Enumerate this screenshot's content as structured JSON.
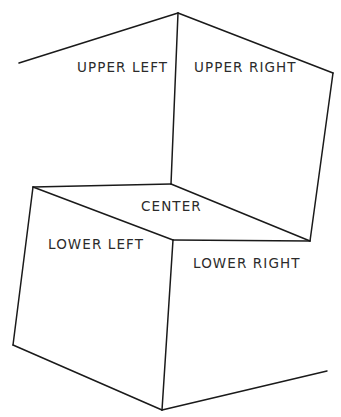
{
  "figure": {
    "background_color": "#ffffff",
    "stroke_color": "#1a1a1a",
    "text_color": "#2b2b2b"
  },
  "labels": {
    "upper_left": "UPPER LEFT",
    "upper_right": "UPPER RIGHT",
    "center": "CENTER",
    "lower_left": "LOWER LEFT",
    "lower_right": "LOWER RIGHT"
  },
  "chart_data": {
    "type": "diagram",
    "regions": [
      {
        "name": "UPPER LEFT",
        "label_x": 77,
        "label_y": 61
      },
      {
        "name": "UPPER RIGHT",
        "label_x": 194,
        "label_y": 61
      },
      {
        "name": "CENTER",
        "label_x": 141,
        "label_y": 200
      },
      {
        "name": "LOWER LEFT",
        "label_x": 48,
        "label_y": 238
      },
      {
        "name": "LOWER RIGHT",
        "label_x": 193,
        "label_y": 257
      }
    ],
    "vertices": {
      "top_apex": [
        178,
        13
      ],
      "upper_left_end": [
        19,
        63
      ],
      "upper_right_end": [
        333,
        73
      ],
      "center_junction": [
        171,
        184
      ],
      "left_corner": [
        33,
        187
      ],
      "right_corner": [
        310,
        241
      ],
      "front_vertex": [
        173,
        240
      ],
      "bottom_apex": [
        162,
        410
      ],
      "bottom_left_end": [
        13,
        345
      ],
      "bottom_right_end": [
        327,
        371
      ]
    },
    "edges": [
      {
        "name": "upper-left-roof",
        "points": "19,63 178,13"
      },
      {
        "name": "upper-right-roof",
        "points": "178,13 333,73"
      },
      {
        "name": "vertical-upper",
        "points": "178,13 171,184"
      },
      {
        "name": "right-side",
        "points": "333,73 310,241"
      },
      {
        "name": "top-left-fold",
        "points": "33,187 171,184"
      },
      {
        "name": "center-right-fold",
        "points": "171,184 310,241"
      },
      {
        "name": "inner-left-fold",
        "points": "33,187 173,240"
      },
      {
        "name": "inner-right-fold",
        "points": "173,240 310,241"
      },
      {
        "name": "left-side",
        "points": "33,187 13,345"
      },
      {
        "name": "vertical-lower",
        "points": "173,240 162,410"
      },
      {
        "name": "bottom-left-edge",
        "points": "13,345 162,410"
      },
      {
        "name": "bottom-right-edge",
        "points": "162,410 327,371"
      }
    ],
    "grid": false,
    "legend": null
  }
}
